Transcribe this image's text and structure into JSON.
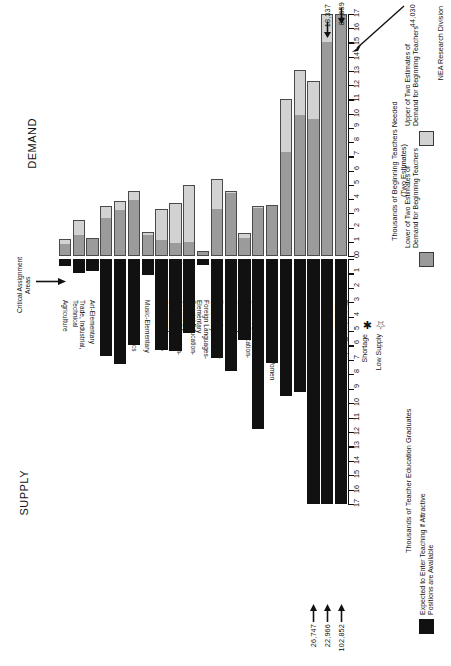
{
  "titles": {
    "demand": "DEMAND",
    "supply": "SUPPLY",
    "critical": "Critical\nAssignment\nAreas"
  },
  "axis_captions": {
    "demand": "Thousands of Beginning Teachers Needed\n(Two Estimates)",
    "supply": "Thousands of Teacher Education Graduates"
  },
  "legend": {
    "upper": "Upper of Two Estimates of\nDemand for Beginning Teachers",
    "lower": "Lower of Two Estimates of\nDemand for Beginning Teachers",
    "supply": "Expected to Enter Teaching if Attractive\nPositions are Available",
    "shortage": "Shortage",
    "low_supply": "Low Supply",
    "shortage_glyph": "✱",
    "low_supply_glyph": "☆"
  },
  "source": "NEA Research Division",
  "callouts": {
    "demand": [
      {
        "label": "18,337",
        "category": "English Language Arts"
      },
      {
        "label": "83,659",
        "category": "Elementary: Regular Instruction"
      },
      {
        "label": "44,030",
        "category": "Elementary: Regular Instruction"
      }
    ],
    "supply": [
      {
        "label": "26,747",
        "category": "Social Studies"
      },
      {
        "label": "22,966",
        "category": "English Language Arts"
      },
      {
        "label": "102,852",
        "category": "Elementary: Regular Instruction"
      }
    ]
  },
  "chart_data": {
    "type": "bar",
    "orientation": "back-to-back vertical (rotated page)",
    "categories": [
      "Agriculture",
      "Trade, Industrial,\nTechnical",
      "Art-Elementary",
      "Art-Secondary",
      "Industrial Arts",
      "Home Economics",
      "Music-Elementary",
      "Music-Secondary",
      "Special Education-\nElementary",
      "Special Education-\nSecondary",
      "Foreign Languages-\nElementary",
      "Foreign Languages-\nSecondary",
      "Business Education",
      "Physical Education-\nElementary",
      "Physical Education-Men",
      "Physical Education-Women",
      "Sciences",
      "Mathematics",
      "Social Studies",
      "English Language Arts",
      "Elementary: Regular\nInstruction"
    ],
    "markers": [
      "",
      "shortage",
      "",
      "",
      "low_supply",
      "",
      "",
      "",
      "",
      "",
      "",
      "",
      "",
      "",
      "",
      "",
      "",
      "shortage",
      "low_supply",
      "",
      ""
    ],
    "demand": {
      "ylabel": "Thousands of Beginning Teachers Needed (Two Estimates)",
      "ylim": [
        0,
        17
      ],
      "ticks": [
        0,
        1,
        2,
        3,
        4,
        5,
        6,
        7,
        8,
        9,
        10,
        11,
        12,
        13,
        14,
        15,
        16,
        17
      ],
      "series": [
        {
          "name": "Lower of Two Estimates of Demand for Beginning Teachers",
          "color": "#9b9b9b",
          "values": [
            0.85,
            1.5,
            1.2,
            2.7,
            3.2,
            3.9,
            1.5,
            1.1,
            0.9,
            1.0,
            0.25,
            3.3,
            4.4,
            1.3,
            3.4,
            3.5,
            7.3,
            9.9,
            9.6,
            15.0,
            17.0
          ]
        },
        {
          "name": "Upper of Two Estimates of Demand for Beginning Teachers",
          "color": "#d2d2d2",
          "values": [
            1.2,
            2.5,
            1.3,
            3.5,
            3.9,
            4.6,
            1.7,
            3.3,
            3.7,
            5.0,
            0.35,
            5.4,
            4.6,
            1.6,
            3.5,
            3.6,
            11.0,
            13.1,
            12.3,
            18.337,
            83.659
          ]
        }
      ]
    },
    "supply": {
      "ylabel": "Thousands of Teacher Education Graduates",
      "ylim": [
        0,
        17
      ],
      "reversed": true,
      "ticks": [
        0,
        1,
        2,
        3,
        4,
        5,
        6,
        7,
        8,
        9,
        10,
        11,
        12,
        13,
        14,
        15,
        16,
        17
      ],
      "series": [
        {
          "name": "Expected to Enter Teaching if Attractive Positions are Available",
          "color": "#111111",
          "values": [
            0.5,
            1.0,
            0.8,
            6.7,
            7.3,
            6.0,
            1.1,
            6.3,
            6.4,
            5.1,
            0.4,
            6.9,
            7.8,
            5.6,
            11.8,
            7.2,
            9.5,
            9.2,
            26.747,
            22.966,
            102.852
          ]
        }
      ]
    }
  }
}
